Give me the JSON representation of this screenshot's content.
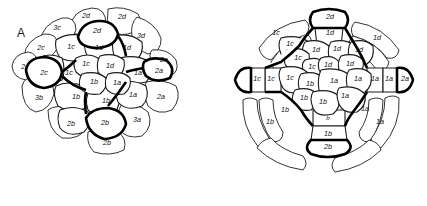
{
  "figure": {
    "panel_label": "A",
    "background_color": "#ffffff",
    "line_color": "#1c1c1c",
    "bold_line_color": "#000000",
    "text_color": "#111111"
  },
  "diagrams": [
    {
      "id": "left-embryo",
      "name": "embryo-animal-view-left",
      "description": "Spiralian embryo cell lineage map, animal pole view",
      "cells": [
        {
          "label": "2d",
          "x": 86,
          "y": 16,
          "emphasis": "normal"
        },
        {
          "label": "2d",
          "x": 122,
          "y": 17,
          "emphasis": "normal"
        },
        {
          "label": "3c",
          "x": 57,
          "y": 28,
          "emphasis": "normal"
        },
        {
          "label": "2d",
          "x": 97,
          "y": 31,
          "emphasis": "bold"
        },
        {
          "label": "3d",
          "x": 141,
          "y": 36,
          "emphasis": "normal"
        },
        {
          "label": "2c",
          "x": 41,
          "y": 48,
          "emphasis": "normal"
        },
        {
          "label": "1c",
          "x": 71,
          "y": 47,
          "emphasis": "normal"
        },
        {
          "label": "1d",
          "x": 99,
          "y": 48,
          "emphasis": "normal"
        },
        {
          "label": "1d",
          "x": 127,
          "y": 48,
          "emphasis": "normal"
        },
        {
          "label": "2c",
          "x": 25,
          "y": 67,
          "emphasis": "normal"
        },
        {
          "label": "1c",
          "x": 86,
          "y": 64,
          "emphasis": "normal"
        },
        {
          "label": "1d",
          "x": 110,
          "y": 66,
          "emphasis": "normal"
        },
        {
          "label": "2a",
          "x": 164,
          "y": 60,
          "emphasis": "normal"
        },
        {
          "label": "2c",
          "x": 44,
          "y": 73,
          "emphasis": "bold"
        },
        {
          "label": "1c",
          "x": 69,
          "y": 73,
          "emphasis": "normal"
        },
        {
          "label": "1a",
          "x": 138,
          "y": 73,
          "emphasis": "normal"
        },
        {
          "label": "2a",
          "x": 159,
          "y": 71,
          "emphasis": "bold"
        },
        {
          "label": "1b",
          "x": 94,
          "y": 82,
          "emphasis": "normal"
        },
        {
          "label": "1a",
          "x": 117,
          "y": 83,
          "emphasis": "normal"
        },
        {
          "label": "3b",
          "x": 39,
          "y": 98,
          "emphasis": "normal"
        },
        {
          "label": "1b",
          "x": 76,
          "y": 97,
          "emphasis": "normal"
        },
        {
          "label": "1b",
          "x": 106,
          "y": 101,
          "emphasis": "normal"
        },
        {
          "label": "1a",
          "x": 133,
          "y": 95,
          "emphasis": "normal"
        },
        {
          "label": "2a",
          "x": 161,
          "y": 97,
          "emphasis": "normal"
        },
        {
          "label": "2b",
          "x": 71,
          "y": 124,
          "emphasis": "normal"
        },
        {
          "label": "2b",
          "x": 105,
          "y": 123,
          "emphasis": "bold"
        },
        {
          "label": "3a",
          "x": 137,
          "y": 120,
          "emphasis": "normal"
        },
        {
          "label": "2b",
          "x": 107,
          "y": 143,
          "emphasis": "normal"
        }
      ]
    },
    {
      "id": "right-embryo",
      "name": "embryo-animal-view-right",
      "description": "Spiralian embryo cell lineage map with cross-shaped arms, animal pole view",
      "cells": [
        {
          "label": "2d",
          "x": 117,
          "y": 17,
          "emphasis": "bold"
        },
        {
          "label": "1c",
          "x": 63,
          "y": 33,
          "emphasis": "normal"
        },
        {
          "label": "1d",
          "x": 117,
          "y": 33,
          "emphasis": "normal"
        },
        {
          "label": "1d",
          "x": 164,
          "y": 38,
          "emphasis": "normal"
        },
        {
          "label": "1c",
          "x": 77,
          "y": 44,
          "emphasis": "normal"
        },
        {
          "label": "1d",
          "x": 103,
          "y": 50,
          "emphasis": "normal"
        },
        {
          "label": "1d",
          "x": 124,
          "y": 49,
          "emphasis": "normal"
        },
        {
          "label": "1d",
          "x": 146,
          "y": 50,
          "emphasis": "normal"
        },
        {
          "label": "1c",
          "x": 85,
          "y": 58,
          "emphasis": "normal"
        },
        {
          "label": "1c",
          "x": 99,
          "y": 67,
          "emphasis": "normal"
        },
        {
          "label": "1d",
          "x": 115,
          "y": 65,
          "emphasis": "normal"
        },
        {
          "label": "1d",
          "x": 137,
          "y": 64,
          "emphasis": "normal"
        },
        {
          "label": "1c",
          "x": 44,
          "y": 79,
          "emphasis": "normal"
        },
        {
          "label": "1c",
          "x": 58,
          "y": 79,
          "emphasis": "normal"
        },
        {
          "label": "1c",
          "x": 77,
          "y": 78,
          "emphasis": "normal"
        },
        {
          "label": "1b",
          "x": 97,
          "y": 84,
          "emphasis": "normal"
        },
        {
          "label": "1a",
          "x": 121,
          "y": 81,
          "emphasis": "normal"
        },
        {
          "label": "1a",
          "x": 145,
          "y": 79,
          "emphasis": "normal"
        },
        {
          "label": "1a",
          "x": 162,
          "y": 79,
          "emphasis": "normal"
        },
        {
          "label": "1a",
          "x": 176,
          "y": 79,
          "emphasis": "normal"
        },
        {
          "label": "2a",
          "x": 192,
          "y": 79,
          "emphasis": "bold"
        },
        {
          "label": "1b",
          "x": 91,
          "y": 98,
          "emphasis": "normal"
        },
        {
          "label": "1a",
          "x": 132,
          "y": 96,
          "emphasis": "normal"
        },
        {
          "label": "1b",
          "x": 110,
          "y": 102,
          "emphasis": "normal"
        },
        {
          "label": "1b",
          "x": 72,
          "y": 110,
          "emphasis": "normal"
        },
        {
          "label": "1a",
          "x": 152,
          "y": 109,
          "emphasis": "normal"
        },
        {
          "label": "1b",
          "x": 57,
          "y": 122,
          "emphasis": "normal"
        },
        {
          "label": "b",
          "x": 115,
          "y": 118,
          "emphasis": "normal"
        },
        {
          "label": "1a",
          "x": 167,
          "y": 122,
          "emphasis": "normal"
        },
        {
          "label": "1b",
          "x": 115,
          "y": 134,
          "emphasis": "normal"
        },
        {
          "label": "2b",
          "x": 115,
          "y": 147,
          "emphasis": "bold"
        }
      ]
    }
  ]
}
